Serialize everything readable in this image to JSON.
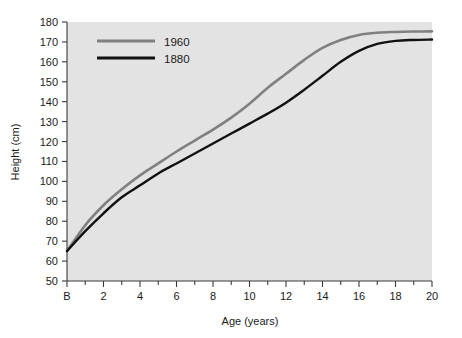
{
  "chart_data": {
    "type": "line",
    "title": "",
    "xlabel": "Age (years)",
    "ylabel": "Height (cm)",
    "xlim": [
      0,
      20
    ],
    "ylim": [
      50,
      180
    ],
    "grid": false,
    "legend_position": "top-left",
    "plot_background": "#e3e3e3",
    "figure_background": "#ffffff",
    "x_tick_labels": [
      "B",
      "2",
      "4",
      "6",
      "8",
      "10",
      "12",
      "14",
      "16",
      "18",
      "20"
    ],
    "x_tick_values": [
      0,
      2,
      4,
      6,
      8,
      10,
      12,
      14,
      16,
      18,
      20
    ],
    "x_minor_tick_values": [
      1,
      3,
      5,
      7,
      9,
      11,
      13,
      15,
      17,
      19
    ],
    "y_tick_labels": [
      "50",
      "60",
      "70",
      "80",
      "90",
      "100",
      "110",
      "120",
      "130",
      "140",
      "150",
      "160",
      "170",
      "180"
    ],
    "y_tick_values": [
      50,
      60,
      70,
      80,
      90,
      100,
      110,
      120,
      130,
      140,
      150,
      160,
      170,
      180
    ],
    "x": [
      0,
      1,
      2,
      3,
      4,
      5,
      6,
      7,
      8,
      9,
      10,
      11,
      12,
      13,
      14,
      15,
      16,
      17,
      18,
      19,
      20
    ],
    "series": [
      {
        "name": "1960",
        "color": "#808080",
        "line_width": 2.6,
        "values": [
          65,
          78,
          88,
          96,
          103,
          109,
          115,
          120.5,
          126,
          132,
          139,
          147,
          154,
          161,
          167,
          171,
          173.5,
          174.6,
          175,
          175.2,
          175.3
        ]
      },
      {
        "name": "1880",
        "color": "#111111",
        "line_width": 2.4,
        "values": [
          65,
          75,
          84,
          92,
          98,
          104,
          109,
          114,
          119,
          124,
          129,
          134,
          139.5,
          146,
          153,
          160,
          165.5,
          169,
          170.5,
          171,
          171.2
        ]
      }
    ]
  },
  "legend": {
    "entries": [
      {
        "label": "1960",
        "color": "#808080"
      },
      {
        "label": "1880",
        "color": "#111111"
      }
    ]
  }
}
